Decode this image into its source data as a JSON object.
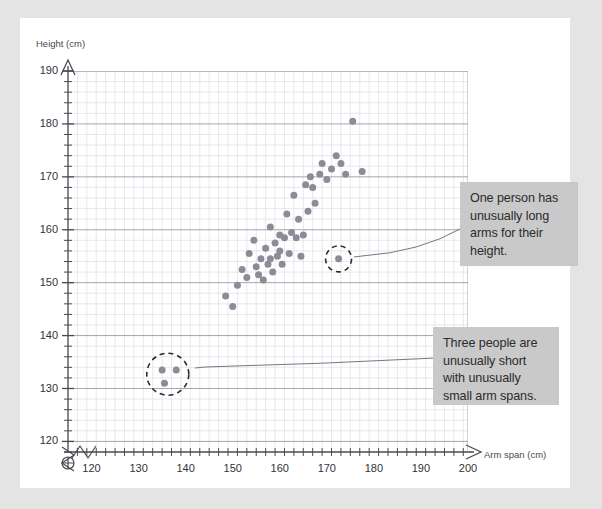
{
  "page": {
    "background_color": "#e4e4e4",
    "card_color": "#ffffff"
  },
  "axes": {
    "y_title": "Height (cm)",
    "x_title": "Arm span (cm)",
    "y_ticks": [
      120,
      130,
      140,
      150,
      160,
      170,
      180,
      190
    ],
    "x_ticks": [
      120,
      130,
      140,
      150,
      160,
      170,
      180,
      190,
      200
    ],
    "y_minor_step": 2,
    "x_minor_step": 2,
    "origin_marker": "crossed-circle",
    "break_marker": "zigzag"
  },
  "callouts": [
    {
      "name": "long-arms",
      "text": "One person has unusually long arms for their height.",
      "background": "#c9c9c9"
    },
    {
      "name": "short-people",
      "text": "Three people are unusually short with unusually small arm spans.",
      "background": "#c9c9c9"
    }
  ],
  "chart_data": {
    "type": "scatter",
    "title": "",
    "xlabel": "Arm span (cm)",
    "ylabel": "Height (cm)",
    "xlim": [
      115,
      200
    ],
    "ylim": [
      118,
      190
    ],
    "grid": true,
    "legend": false,
    "point_color": "#8c8c99",
    "points": [
      {
        "x": 148.5,
        "y": 147.5
      },
      {
        "x": 150.0,
        "y": 145.5
      },
      {
        "x": 151.0,
        "y": 149.5
      },
      {
        "x": 152.0,
        "y": 152.5
      },
      {
        "x": 153.0,
        "y": 151.0
      },
      {
        "x": 153.5,
        "y": 155.5
      },
      {
        "x": 154.5,
        "y": 158.0
      },
      {
        "x": 155.0,
        "y": 153.0
      },
      {
        "x": 155.5,
        "y": 151.5
      },
      {
        "x": 156.0,
        "y": 154.5
      },
      {
        "x": 156.5,
        "y": 150.5
      },
      {
        "x": 157.0,
        "y": 156.5
      },
      {
        "x": 157.5,
        "y": 153.5
      },
      {
        "x": 158.0,
        "y": 160.5
      },
      {
        "x": 158.0,
        "y": 154.5
      },
      {
        "x": 158.5,
        "y": 152.0
      },
      {
        "x": 159.0,
        "y": 157.5
      },
      {
        "x": 159.5,
        "y": 155.0
      },
      {
        "x": 160.0,
        "y": 159.0
      },
      {
        "x": 160.0,
        "y": 156.0
      },
      {
        "x": 160.5,
        "y": 153.5
      },
      {
        "x": 161.0,
        "y": 158.5
      },
      {
        "x": 161.5,
        "y": 163.0
      },
      {
        "x": 162.0,
        "y": 155.5
      },
      {
        "x": 162.5,
        "y": 159.5
      },
      {
        "x": 163.0,
        "y": 166.5
      },
      {
        "x": 163.5,
        "y": 158.5
      },
      {
        "x": 164.0,
        "y": 162.0
      },
      {
        "x": 164.5,
        "y": 155.0
      },
      {
        "x": 165.0,
        "y": 159.0
      },
      {
        "x": 165.5,
        "y": 168.5
      },
      {
        "x": 166.0,
        "y": 163.5
      },
      {
        "x": 166.5,
        "y": 170.0
      },
      {
        "x": 167.0,
        "y": 168.0
      },
      {
        "x": 167.5,
        "y": 165.0
      },
      {
        "x": 168.5,
        "y": 170.5
      },
      {
        "x": 169.0,
        "y": 172.5
      },
      {
        "x": 170.0,
        "y": 169.5
      },
      {
        "x": 171.0,
        "y": 171.5
      },
      {
        "x": 172.0,
        "y": 174.0
      },
      {
        "x": 173.0,
        "y": 172.5
      },
      {
        "x": 174.0,
        "y": 170.5
      },
      {
        "x": 175.5,
        "y": 180.5
      },
      {
        "x": 177.5,
        "y": 171.0
      },
      {
        "x": 172.5,
        "y": 154.5
      },
      {
        "x": 135.0,
        "y": 133.5
      },
      {
        "x": 138.0,
        "y": 133.5
      },
      {
        "x": 135.5,
        "y": 131.0
      }
    ],
    "highlights": [
      {
        "name": "long-arms-outlier",
        "shape": "dashed-circle",
        "center": {
          "x": 172.5,
          "y": 154.5
        },
        "count": 1
      },
      {
        "name": "short-people-outliers",
        "shape": "dashed-circle",
        "center": {
          "x": 136.2,
          "y": 132.7
        },
        "count": 3
      }
    ]
  }
}
